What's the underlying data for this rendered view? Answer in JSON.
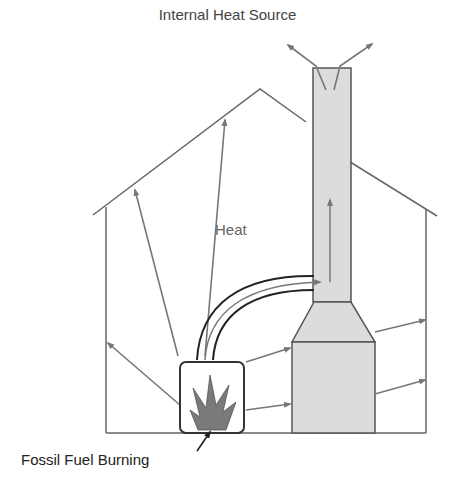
{
  "diagram": {
    "title": "Internal Heat Source",
    "labels": {
      "heat": "Heat",
      "fuel": "Fossil Fuel Burning"
    },
    "colors": {
      "outline": "#666666",
      "chimney_fill": "#dcdcdc",
      "flame": "#7a7a7a",
      "arrow": "#777777",
      "text": "#444444"
    },
    "elements": [
      "house-outline",
      "chimney",
      "stove-firebox",
      "flame",
      "heat-radiation-arrows",
      "flue-pipe",
      "smoke-exhaust-arrows"
    ]
  }
}
